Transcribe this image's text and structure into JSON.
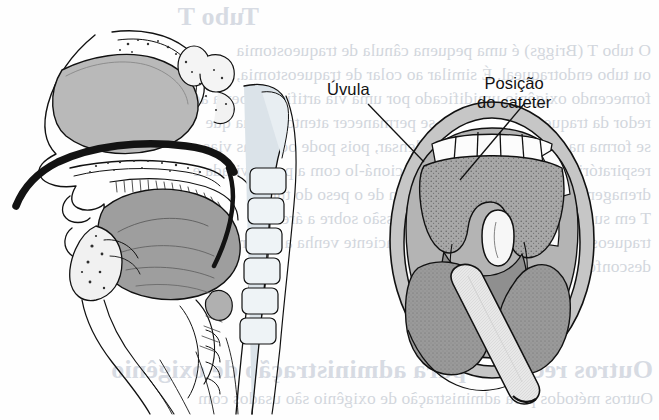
{
  "figure": {
    "type": "anatomical-illustration",
    "labels": [
      {
        "id": "uvula",
        "text": "Úvula",
        "x": 327,
        "y": 82,
        "lines": [
          "Úvula"
        ]
      },
      {
        "id": "catheter",
        "text": "Posição do cateter",
        "x": 477,
        "y": 76,
        "lines": [
          "Posição",
          "do cateter"
        ]
      }
    ],
    "leaders": [
      {
        "id": "uvula-leader",
        "from": [
          368,
          104
        ],
        "to": [
          423,
          160
        ]
      },
      {
        "id": "catheter-leader",
        "from": [
          522,
          104
        ],
        "to": [
          459,
          178
        ]
      }
    ],
    "colors": {
      "ink": "#111111",
      "tissue_mid": "#9b9b9b",
      "tissue_light": "#c9c9c9",
      "tissue_pale": "#e2e2e2",
      "bone_tint": "#d7dee4",
      "catheter_black": "#141414",
      "paper": "#fefefe",
      "bleed_text": "#7e8ea6"
    }
  },
  "bleed_through": {
    "note": "Mirrored text showing through from the reverse side of the printed page",
    "headings": [
      {
        "text": "Tubo T",
        "x": 400,
        "y": 2
      },
      {
        "text": "Outros recursos para administração de oxigênio",
        "x": 6,
        "y": 355
      }
    ],
    "lines": [
      {
        "text": "O tubo T (Briggs) é uma pequena cânula de traqueostomia",
        "x": 8,
        "y": 40
      },
      {
        "text": "ou tubo endotraqueal. É similar ao colar de traqueostomia,",
        "x": 8,
        "y": 64
      },
      {
        "text": "fornecendo oxigênio umidificado por uma via artificial aberta ao",
        "x": 8,
        "y": 88
      },
      {
        "text": "redor da traqueostomia. Deve-se permanecer atento à água que",
        "x": 8,
        "y": 112
      },
      {
        "text": "se forma na tubulação ao se condensar, pois pode ocluir as vias",
        "x": 8,
        "y": 136
      },
      {
        "text": "respiratórias. Há vantagens de posicioná-lo com a ponta virada e",
        "x": 8,
        "y": 160
      },
      {
        "text": "drenagem, mas existe a desvantagem de o peso do tubo",
        "x": 8,
        "y": 184
      },
      {
        "text": "T em sua fixação poderá exercer pressão sobre a área de",
        "x": 8,
        "y": 208
      },
      {
        "text": "traqueostomia, fazendo com que o paciente venha a sentir algum",
        "x": 8,
        "y": 232
      },
      {
        "text": "desconforto.",
        "x": 8,
        "y": 256
      },
      {
        "text": "Outros métodos para administração de oxigênio são usados com",
        "x": 6,
        "y": 388
      }
    ]
  }
}
